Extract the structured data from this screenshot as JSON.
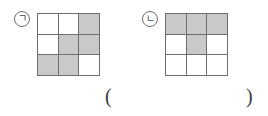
{
  "page": {
    "background_color": "#ffffff",
    "width": 268,
    "height": 116
  },
  "style": {
    "shaded_cell_color": "#c9c9c9",
    "empty_cell_color": "#ffffff",
    "grid_line_color": "#6e6e6e",
    "label_circle_color": "#6f6f6f",
    "text_color": "#3a3a3a"
  },
  "figures": [
    {
      "label": "ㄱ",
      "label_name": "figure-label-giyeok",
      "grid": {
        "rows": 3,
        "cols": 3,
        "cells": [
          [
            "empty",
            "empty",
            "shaded"
          ],
          [
            "empty",
            "shaded",
            "shaded"
          ],
          [
            "shaded",
            "shaded",
            "empty"
          ]
        ],
        "shaded_count": 5,
        "empty_count": 4
      }
    },
    {
      "label": "ㄴ",
      "label_name": "figure-label-nieun",
      "grid": {
        "rows": 3,
        "cols": 3,
        "cells": [
          [
            "shaded",
            "shaded",
            "shaded"
          ],
          [
            "empty",
            "shaded",
            "empty"
          ],
          [
            "empty",
            "empty",
            "empty"
          ]
        ],
        "shaded_count": 4,
        "empty_count": 5
      }
    }
  ],
  "answer_blank": {
    "open_paren": "(",
    "close_paren": ")",
    "value": ""
  }
}
